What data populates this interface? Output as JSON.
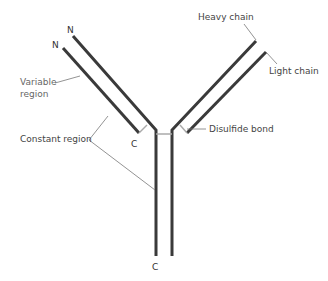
{
  "diagram": {
    "type": "antibody-structure",
    "labels": {
      "heavy_chain": "Heavy chain",
      "light_chain": "Light chain",
      "variable_region": "Variable\nregion",
      "variable_region_line1": "Variable",
      "variable_region_line2": "region",
      "constant_region": "Constant region",
      "disulfide_bond": "Disulfide bond"
    },
    "termini": {
      "left_heavy_n": "N",
      "left_light_n": "N",
      "left_light_c": "C",
      "stem_c": "C"
    },
    "colors": {
      "chain": "#3a3a3a",
      "bond": "#aaaaaa",
      "leader": "#777777",
      "text": "#444444"
    }
  }
}
